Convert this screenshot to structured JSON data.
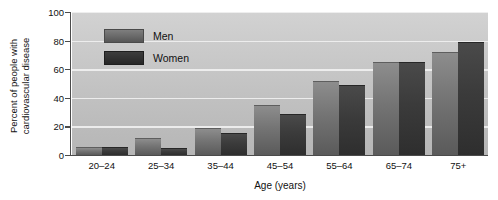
{
  "chart_data": {
    "type": "bar",
    "title": "",
    "subtitle": "",
    "xlabel": "Age (years)",
    "ylabel": "Percent of people with cardiovascular disease",
    "ylabel_line1": "Percent of people with",
    "ylabel_line2": "cardiovascular disease",
    "categories": [
      "20–24",
      "25–34",
      "35–44",
      "45–54",
      "55–64",
      "65–74",
      "75+"
    ],
    "series": [
      {
        "name": "Men",
        "values": [
          5,
          11,
          18,
          34,
          51,
          64,
          71
        ]
      },
      {
        "name": "Women",
        "values": [
          5,
          4,
          15,
          28,
          48,
          64,
          78
        ]
      }
    ],
    "ylim": [
      0,
      100
    ],
    "yticks": [
      0,
      20,
      40,
      60,
      80,
      100
    ],
    "ytick_labels": [
      "0",
      "20",
      "40",
      "60",
      "80",
      "100"
    ],
    "grid": true,
    "grid_axis": "y",
    "legend_position": "upper-left-inside",
    "colors": {
      "men": "#6e6e6e",
      "women": "#333333",
      "plot_background": "#c6c6c6",
      "gridline": "#f0f0f0",
      "axis": "#4b4b4b",
      "text": "#111111",
      "figure_background": "#ffffff"
    }
  },
  "legend": {
    "entries": [
      {
        "label": "Men",
        "key": "men"
      },
      {
        "label": "Women",
        "key": "women"
      }
    ]
  }
}
